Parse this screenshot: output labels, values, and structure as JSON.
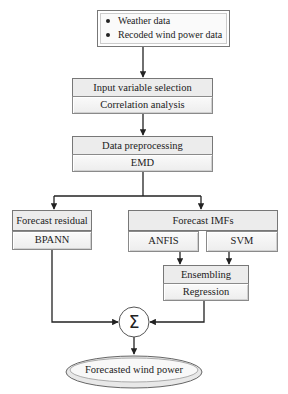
{
  "diagram": {
    "type": "flowchart",
    "input_box": {
      "items": [
        "Weather data",
        "Recoded wind power data"
      ]
    },
    "input_selection": {
      "title": "Input variable selection",
      "method": "Correlation analysis"
    },
    "preprocessing": {
      "title": "Data preprocessing",
      "method": "EMD"
    },
    "residual_branch": {
      "title": "Forecast residual",
      "method": "BPANN"
    },
    "imf_branch": {
      "title": "Forecast IMFs",
      "methods": [
        "ANFIS",
        "SVM"
      ]
    },
    "ensembling": {
      "title": "Ensembling",
      "method": "Regression"
    },
    "sum_node": {
      "symbol": "Σ"
    },
    "output": {
      "label": "Forecasted wind power"
    },
    "edges": [
      [
        "input_box",
        "input_selection"
      ],
      [
        "input_selection",
        "preprocessing"
      ],
      [
        "preprocessing",
        "residual_branch"
      ],
      [
        "preprocessing",
        "imf_branch"
      ],
      [
        "ANFIS",
        "ensembling"
      ],
      [
        "SVM",
        "ensembling"
      ],
      [
        "residual_branch",
        "sum_node"
      ],
      [
        "ensembling",
        "sum_node"
      ],
      [
        "sum_node",
        "output"
      ]
    ]
  }
}
